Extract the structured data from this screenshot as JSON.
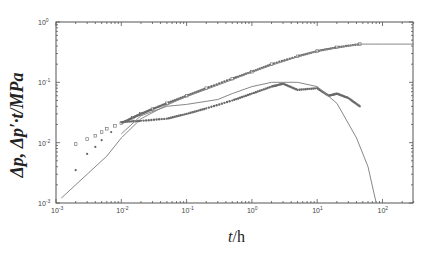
{
  "chart_data": {
    "type": "scatter",
    "title": "",
    "xlabel": "t/h",
    "ylabel": "Δp, Δp′·t/MPa",
    "xscale": "log",
    "yscale": "log",
    "xlim": [
      0.001,
      300
    ],
    "ylim": [
      0.001,
      1
    ],
    "x_ticks": [
      "10^-3",
      "10^-2",
      "10^-1",
      "10^0",
      "10^1",
      "10^2"
    ],
    "y_ticks": [
      "10^-3",
      "10^-2",
      "10^-1",
      "10^0"
    ],
    "grid": false,
    "legend": null,
    "series": [
      {
        "name": "Δp measured",
        "style": "markers",
        "x": [
          0.002,
          0.003,
          0.004,
          0.005,
          0.006,
          0.008,
          0.01,
          0.015,
          0.02,
          0.03,
          0.05,
          0.1,
          0.2,
          0.5,
          1,
          2,
          5,
          10,
          20,
          45
        ],
        "y": [
          0.0095,
          0.0115,
          0.013,
          0.015,
          0.017,
          0.019,
          0.021,
          0.026,
          0.03,
          0.036,
          0.045,
          0.06,
          0.08,
          0.115,
          0.15,
          0.2,
          0.27,
          0.33,
          0.38,
          0.43
        ]
      },
      {
        "name": "Δp model",
        "style": "line",
        "x": [
          0.0012,
          0.003,
          0.006,
          0.01,
          0.02,
          0.05,
          0.1,
          0.5,
          1,
          5,
          10,
          45,
          100,
          300
        ],
        "y": [
          0.0012,
          0.003,
          0.006,
          0.012,
          0.025,
          0.042,
          0.058,
          0.11,
          0.15,
          0.265,
          0.33,
          0.43,
          0.43,
          0.43
        ]
      },
      {
        "name": "Δp′·t measured",
        "style": "markers",
        "x": [
          0.002,
          0.003,
          0.004,
          0.005,
          0.007,
          0.01,
          0.02,
          0.05,
          0.1,
          0.2,
          0.5,
          1,
          2,
          3,
          5,
          10,
          15,
          20,
          30,
          45
        ],
        "y": [
          0.0035,
          0.0065,
          0.0085,
          0.011,
          0.015,
          0.022,
          0.023,
          0.025,
          0.03,
          0.037,
          0.05,
          0.065,
          0.085,
          0.095,
          0.075,
          0.08,
          0.06,
          0.065,
          0.055,
          0.04
        ]
      },
      {
        "name": "Δp′·t model",
        "style": "line",
        "x": [
          0.01,
          0.02,
          0.05,
          0.1,
          0.3,
          0.5,
          1,
          2,
          5,
          10,
          20,
          40,
          60,
          80
        ],
        "y": [
          0.014,
          0.028,
          0.04,
          0.043,
          0.052,
          0.065,
          0.085,
          0.1,
          0.1,
          0.085,
          0.045,
          0.012,
          0.004,
          0.001
        ]
      }
    ]
  },
  "axes": {
    "xlabel_var": "t",
    "xlabel_unit": "/h",
    "ylabel": "Δp, Δp′·t/MPa"
  }
}
